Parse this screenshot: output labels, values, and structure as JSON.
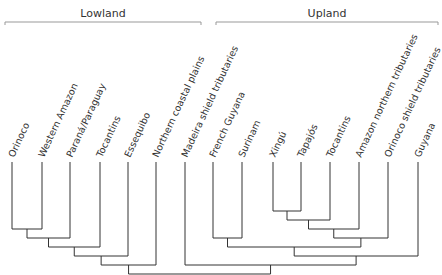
{
  "groups": [
    {
      "label": "Lowland",
      "from_leaf": 0,
      "to_leaf": 6
    },
    {
      "label": "Upland",
      "from_leaf": 7,
      "to_leaf": 14
    }
  ],
  "leaves": [
    "Orinoco",
    "Western Amazon",
    "Paraná/Paraguay",
    "Tocantins",
    "Essequibo",
    "Northern coastal plains",
    "Madeira shield tributaries",
    "French Guyana",
    "Surinam",
    "Xingú",
    "Tapajós",
    "Tocantins",
    "Amazon northern tributaries",
    "Orinoco shield tributaries",
    "Guyana"
  ],
  "tree": [
    [
      [
        [
          [
            [
              [
                "Orinoco",
                "Western Amazon"
              ],
              "Paraná/Paraguay"
            ],
            "Tocantins"
          ],
          "Essequibo"
        ],
        "Northern coastal plains"
      ]
    ],
    [
      [
        "Madeira shield tributaries",
        [
          [
            [
              "French Guyana",
              "Surinam"
            ],
            [
              [
                [
                  [
                    "Xingú",
                    "Tapajós"
                  ],
                  "Tocantins (U)"
                ],
                "Amazon northern tributaries"
              ],
              "Orinoco shield tributaries"
            ]
          ],
          "Guyana"
        ]
      ]
    ]
  ],
  "merges": [
    {
      "a": 0,
      "b": 1,
      "level": 1
    },
    {
      "a": "m0",
      "b": 2,
      "level": 2
    },
    {
      "a": "m1",
      "b": 3,
      "level": 3
    },
    {
      "a": "m2",
      "b": 4,
      "level": 4
    },
    {
      "a": "m3",
      "b": 5,
      "level": 5
    },
    {
      "a": 7,
      "b": 8,
      "level": 2
    },
    {
      "a": 9,
      "b": 10,
      "level": -1
    },
    {
      "a": "m6",
      "b": 11,
      "level": 0
    },
    {
      "a": "m7",
      "b": 12,
      "level": 1
    },
    {
      "a": "m8",
      "b": 13,
      "level": 2
    },
    {
      "a": "m5",
      "b": "m9",
      "level": 3
    },
    {
      "a": "m10",
      "b": 14,
      "level": 4
    },
    {
      "a": 6,
      "b": "m11",
      "level": 5
    },
    {
      "a": "m4",
      "b": "m12",
      "level": 6
    }
  ]
}
